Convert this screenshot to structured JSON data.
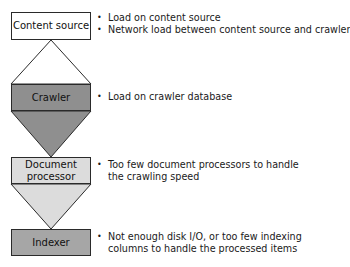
{
  "colors": {
    "content_source": "#ffffff",
    "crawler": "#8f8f8f",
    "document_processor": "#dcdcdc",
    "indexer": "#a6a6a6",
    "outline": "#2a2a2a"
  },
  "stages": [
    {
      "id": "content-source",
      "label": "Content source",
      "bullets": [
        "Load on content source",
        "Network load between content source and crawler"
      ]
    },
    {
      "id": "crawler",
      "label": "Crawler",
      "bullets": [
        "Load on crawler database"
      ]
    },
    {
      "id": "document-processor",
      "label": "Document processor",
      "label_lines": [
        "Document",
        "processor"
      ],
      "bullets": [
        "Too few document processors to handle",
        "the crawling speed"
      ]
    },
    {
      "id": "indexer",
      "label": "Indexer",
      "bullets": [
        "Not enough disk I/O, or too few indexing",
        "columns to handle the processed items"
      ]
    }
  ]
}
